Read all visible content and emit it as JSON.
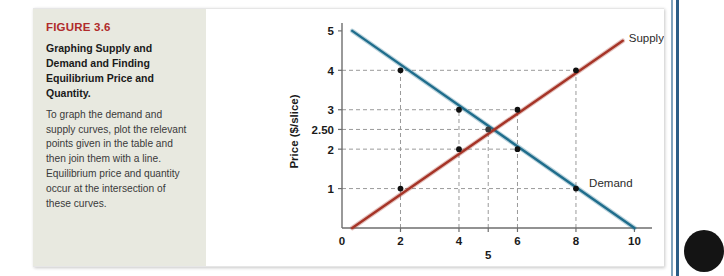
{
  "figure": {
    "number_label": "FIGURE 3.6",
    "title": "Graphing Supply and Demand and Finding Equilibrium Price and Quantity.",
    "body": "To graph the demand and supply curves, plot the relevant points given in the table and then join them with a line. Equilibrium price and quantity occur at the intersection of these curves.",
    "number_color": "#b02b2b",
    "panel_color": "#e8e9e0"
  },
  "chart_data": {
    "type": "line",
    "title": "",
    "xlabel": "Quantity (1,000s of slices/day)",
    "ylabel": "Price ($/slice)",
    "xlim": [
      0,
      10.6
    ],
    "ylim": [
      0,
      5.2
    ],
    "grid": "dashed-guides",
    "legend_position": "inline-at-curve-end",
    "x_ticks": [
      "0",
      "2",
      "4",
      "5",
      "6",
      "8",
      "10"
    ],
    "x_tick_values": [
      0,
      2,
      4,
      5,
      6,
      8,
      10
    ],
    "x_tick_offset_rows": [
      0,
      0,
      0,
      1,
      0,
      0,
      0
    ],
    "y_ticks": [
      "1",
      "2",
      "2.50",
      "3",
      "4",
      "5"
    ],
    "y_tick_values": [
      1,
      2,
      2.5,
      3,
      4,
      5
    ],
    "series": [
      {
        "name": "Demand",
        "color": "#1f6d8c",
        "label": "Demand",
        "line_from": [
          0.35,
          5.0
        ],
        "line_to": [
          10.0,
          0.0
        ],
        "points": [
          {
            "x": 2,
            "y": 4
          },
          {
            "x": 4,
            "y": 3
          },
          {
            "x": 6,
            "y": 2
          },
          {
            "x": 8,
            "y": 1
          }
        ]
      },
      {
        "name": "Supply",
        "color": "#a63427",
        "label": "Supply",
        "line_from": [
          0.35,
          0.0
        ],
        "line_to": [
          9.6,
          4.75
        ],
        "points": [
          {
            "x": 2,
            "y": 1
          },
          {
            "x": 4,
            "y": 2
          },
          {
            "x": 6,
            "y": 3
          },
          {
            "x": 8,
            "y": 4
          }
        ]
      }
    ],
    "equilibrium": {
      "x": 5,
      "y": 2.5,
      "price_label": "2.50",
      "quantity_label": "5"
    },
    "annotations": [
      {
        "text": "Supply",
        "at": [
          9.6,
          4.75
        ]
      },
      {
        "text": "Demand",
        "at": [
          8.4,
          1.05
        ]
      }
    ]
  },
  "decor": {
    "divider_color": "#2b5d86",
    "blob_color": "#141414"
  }
}
